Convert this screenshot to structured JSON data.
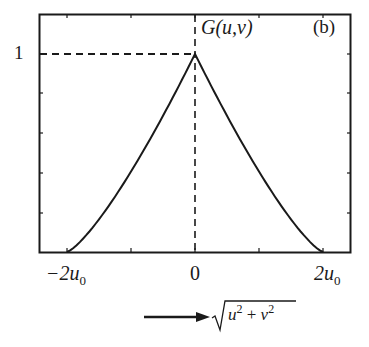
{
  "chart_data": {
    "type": "line",
    "title": "",
    "panel_label": "(b)",
    "series": [
      {
        "name": "G(u,v)",
        "x": [
          -2,
          -1.75,
          -1.5,
          -1.25,
          -1,
          -0.75,
          -0.5,
          -0.25,
          0,
          0.25,
          0.5,
          0.75,
          1,
          1.25,
          1.5,
          1.75,
          2
        ],
        "values": [
          0,
          0.07,
          0.16,
          0.28,
          0.41,
          0.54,
          0.69,
          0.84,
          1,
          0.84,
          0.69,
          0.54,
          0.41,
          0.28,
          0.16,
          0.07,
          0
        ]
      }
    ],
    "x_unit": "u0",
    "xlim": [
      -2.5,
      2.45
    ],
    "ylim": [
      0,
      1.35
    ],
    "xticks": [
      -2,
      -1,
      0,
      1,
      2
    ],
    "xtick_labels": [
      "-2u0",
      "",
      "0",
      "",
      "2u0"
    ],
    "yticks": [
      0,
      0.3375,
      0.675,
      1.0,
      1.35
    ],
    "ytick_labels": [
      "",
      "",
      "",
      "1",
      ""
    ],
    "xlabel": "sqrt(u^2 + v^2)",
    "ylabel": "G(u,v)",
    "annotations": [
      "dashed horizontal line at G=1",
      "dashed vertical line at 0",
      "arrow pointing to x-axis label"
    ],
    "grid": false,
    "legend": "none"
  },
  "labels": {
    "y_one": "1",
    "curve_name": "G(u,v)",
    "panel": "(b)",
    "x_left_prefix": "−2u",
    "x_left_sub": "0",
    "x_zero": "0",
    "x_right_prefix": "2u",
    "x_right_sub": "0",
    "xlabel_u": "u",
    "xlabel_v": "v",
    "xlabel_exp": "2",
    "xlabel_plus": " + "
  },
  "colors": {
    "ink": "#1a1a1a",
    "background": "#ffffff"
  }
}
